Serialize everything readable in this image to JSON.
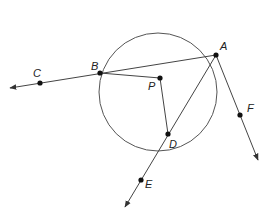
{
  "diagram": {
    "type": "circle-geometry",
    "circle": {
      "center_label": "P",
      "cx": 158,
      "cy": 92,
      "r": 59
    },
    "points": {
      "A": {
        "label": "A",
        "x": 216,
        "y": 55
      },
      "B": {
        "label": "B",
        "x": 100,
        "y": 73
      },
      "C": {
        "label": "C",
        "x": 40,
        "y": 83
      },
      "P": {
        "label": "P",
        "x": 160,
        "y": 78
      },
      "D": {
        "label": "D",
        "x": 168,
        "y": 134
      },
      "E": {
        "label": "E",
        "x": 141,
        "y": 180
      },
      "F": {
        "label": "F",
        "x": 240,
        "y": 115
      }
    },
    "segments": [
      "AB",
      "PB",
      "PD",
      "AD"
    ],
    "rays": [
      "AC (from A through B and C)",
      "AE (from A through D and E)",
      "AF (from A through F)"
    ]
  }
}
